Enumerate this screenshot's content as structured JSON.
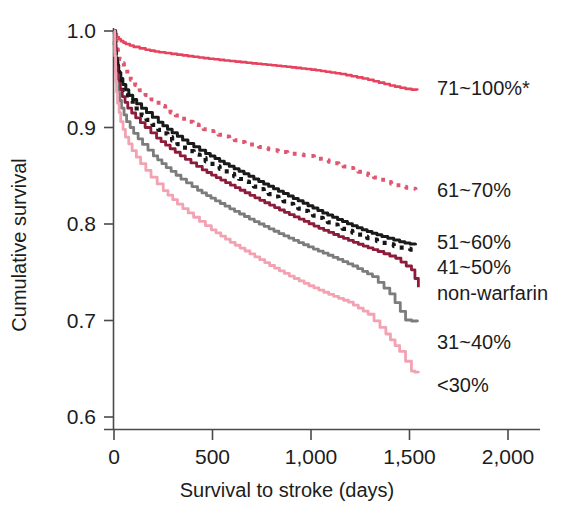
{
  "chart_data": {
    "type": "line",
    "title": "",
    "xlabel": "Survival to stroke  (days)",
    "ylabel": "Cumulative survival",
    "xlim": [
      0,
      2000
    ],
    "ylim": [
      0.6,
      1.0
    ],
    "xticks": [
      0,
      500,
      1000,
      1500,
      2000
    ],
    "xtick_labels": [
      "0",
      "500",
      "1,000",
      "1,500",
      "2,000"
    ],
    "yticks": [
      0.6,
      0.7,
      0.8,
      0.9,
      1.0
    ],
    "ytick_labels": [
      "0.6",
      "0.7",
      "0.8",
      "0.9",
      "1.0"
    ],
    "grid": false,
    "legend_position": "right",
    "series": [
      {
        "name": "71~100%*",
        "color": "#E8435E",
        "style": "solid",
        "width": 2.6,
        "label_x": 437,
        "label_y": 95,
        "x": [
          0,
          15,
          35,
          60,
          100,
          160,
          230,
          320,
          430,
          560,
          700,
          850,
          1000,
          1150,
          1290,
          1400,
          1480,
          1540
        ],
        "y": [
          1.0,
          0.9935,
          0.9895,
          0.9865,
          0.9835,
          0.9805,
          0.978,
          0.9755,
          0.9725,
          0.9695,
          0.9665,
          0.9635,
          0.96,
          0.9555,
          0.9495,
          0.9435,
          0.94,
          0.9385
        ]
      },
      {
        "name": "61~70%",
        "color": "#E05570",
        "style": "dotted",
        "width": 4.0,
        "label_x": 437,
        "label_y": 197,
        "x": [
          0,
          12,
          28,
          50,
          85,
          130,
          190,
          260,
          340,
          430,
          530,
          640,
          760,
          880,
          990,
          1090,
          1190,
          1290,
          1380,
          1460,
          1530
        ],
        "y": [
          1.0,
          0.981,
          0.971,
          0.962,
          0.9495,
          0.9385,
          0.929,
          0.919,
          0.909,
          0.9,
          0.8925,
          0.885,
          0.8785,
          0.8735,
          0.8705,
          0.8645,
          0.858,
          0.8505,
          0.8435,
          0.8385,
          0.8355
        ]
      },
      {
        "name": "51~60%",
        "color": "#1a1a1a",
        "style": "solid",
        "width": 3.0,
        "label_x": 437,
        "label_y": 249,
        "x": [
          0,
          10,
          24,
          45,
          75,
          115,
          165,
          225,
          295,
          375,
          465,
          560,
          660,
          760,
          860,
          960,
          1060,
          1160,
          1260,
          1360,
          1450,
          1530
        ],
        "y": [
          1.0,
          0.972,
          0.957,
          0.9445,
          0.9335,
          0.9245,
          0.9155,
          0.9055,
          0.8945,
          0.8835,
          0.873,
          0.8625,
          0.852,
          0.8415,
          0.8315,
          0.8215,
          0.8115,
          0.8025,
          0.794,
          0.787,
          0.7815,
          0.778
        ]
      },
      {
        "name": "41~50%",
        "color": "#161616",
        "style": "dotted",
        "width": 4.2,
        "label_x": 437,
        "label_y": 274,
        "x": [
          0,
          10,
          24,
          45,
          75,
          115,
          165,
          225,
          295,
          375,
          465,
          560,
          660,
          760,
          860,
          960,
          1060,
          1160,
          1260,
          1360,
          1450,
          1530
        ],
        "y": [
          1.0,
          0.968,
          0.952,
          0.939,
          0.9275,
          0.9175,
          0.908,
          0.8975,
          0.8865,
          0.8755,
          0.865,
          0.8545,
          0.844,
          0.8335,
          0.8235,
          0.8135,
          0.804,
          0.795,
          0.787,
          0.7805,
          0.7755,
          0.7725
        ]
      },
      {
        "name": "non-warfarin",
        "color": "#8C1C3A",
        "style": "solid",
        "width": 2.8,
        "label_x": 437,
        "label_y": 300,
        "x": [
          0,
          10,
          22,
          42,
          70,
          110,
          158,
          216,
          285,
          362,
          448,
          542,
          640,
          740,
          840,
          940,
          1040,
          1140,
          1240,
          1340,
          1430,
          1510,
          1545
        ],
        "y": [
          1.0,
          0.963,
          0.946,
          0.932,
          0.92,
          0.91,
          0.9,
          0.889,
          0.878,
          0.867,
          0.856,
          0.8455,
          0.835,
          0.8245,
          0.8145,
          0.805,
          0.7955,
          0.787,
          0.779,
          0.7715,
          0.7645,
          0.7525,
          0.7345
        ]
      },
      {
        "name": "31~40%",
        "color": "#7C7C7C",
        "style": "solid",
        "width": 2.8,
        "label_x": 437,
        "label_y": 349,
        "x": [
          0,
          8,
          20,
          38,
          64,
          100,
          145,
          200,
          265,
          340,
          424,
          515,
          612,
          712,
          812,
          912,
          1012,
          1112,
          1212,
          1312,
          1400,
          1480,
          1540
        ],
        "y": [
          1.0,
          0.956,
          0.936,
          0.92,
          0.906,
          0.894,
          0.8825,
          0.8705,
          0.8585,
          0.8465,
          0.835,
          0.824,
          0.813,
          0.8025,
          0.7925,
          0.783,
          0.774,
          0.7655,
          0.7565,
          0.7455,
          0.7275,
          0.7005,
          0.6985
        ]
      },
      {
        "name": "<30%",
        "color": "#F3A2B2",
        "style": "solid",
        "width": 2.8,
        "label_x": 437,
        "label_y": 392,
        "x": [
          0,
          8,
          18,
          34,
          58,
          92,
          135,
          188,
          250,
          322,
          404,
          494,
          590,
          690,
          790,
          890,
          990,
          1090,
          1190,
          1290,
          1380,
          1450,
          1510,
          1545
        ],
        "y": [
          1.0,
          0.948,
          0.925,
          0.906,
          0.89,
          0.876,
          0.8625,
          0.8485,
          0.8345,
          0.8205,
          0.807,
          0.794,
          0.781,
          0.769,
          0.757,
          0.746,
          0.736,
          0.727,
          0.719,
          0.7065,
          0.686,
          0.668,
          0.6475,
          0.6455
        ]
      }
    ]
  },
  "legend": {
    "items": [
      {
        "label": "71~100%*",
        "color": "#E8435E"
      },
      {
        "label": "61~70%",
        "color": "#E05570"
      },
      {
        "label": "51~60%",
        "color": "#1a1a1a"
      },
      {
        "label": "41~50%",
        "color": "#161616"
      },
      {
        "label": "non-warfarin",
        "color": "#8C1C3A"
      },
      {
        "label": "31~40%",
        "color": "#7C7C7C"
      },
      {
        "label": "<30%",
        "color": "#F3A2B2"
      }
    ]
  }
}
